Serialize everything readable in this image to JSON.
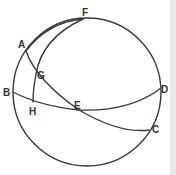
{
  "diagram": {
    "type": "spherical-geometry",
    "sphere": {
      "cx": 87,
      "cy": 92,
      "r": 74
    },
    "points": {
      "A": {
        "x": 26,
        "y": 51
      },
      "B": {
        "x": 13,
        "y": 92
      },
      "C": {
        "x": 149,
        "y": 130
      },
      "D": {
        "x": 161,
        "y": 88
      },
      "E": {
        "x": 79,
        "y": 110
      },
      "F": {
        "x": 83,
        "y": 19
      },
      "G": {
        "x": 36,
        "y": 74
      },
      "H": {
        "x": 33,
        "y": 102
      }
    },
    "labels": [
      {
        "text": "F",
        "x": 82,
        "y": 16
      },
      {
        "text": "A",
        "x": 18,
        "y": 48
      },
      {
        "text": "G",
        "x": 37,
        "y": 79
      },
      {
        "text": "B",
        "x": 3,
        "y": 96
      },
      {
        "text": "H",
        "x": 29,
        "y": 115
      },
      {
        "text": "E",
        "x": 74,
        "y": 109
      },
      {
        "text": "D",
        "x": 161,
        "y": 93
      },
      {
        "text": "C",
        "x": 152,
        "y": 133
      }
    ],
    "arcs": [
      {
        "name": "great-circle-BHED",
        "through": [
          "B",
          "H",
          "E",
          "D"
        ]
      },
      {
        "name": "great-circle-AGEC",
        "through": [
          "A",
          "G",
          "E",
          "C"
        ]
      },
      {
        "name": "arc-FGH",
        "through": [
          "F",
          "G",
          "H"
        ]
      },
      {
        "name": "arc-AF",
        "through": [
          "A",
          "F"
        ]
      }
    ],
    "colors": {
      "stroke": "#3a3a3a",
      "label": "#333333",
      "background": "#ffffff"
    }
  }
}
